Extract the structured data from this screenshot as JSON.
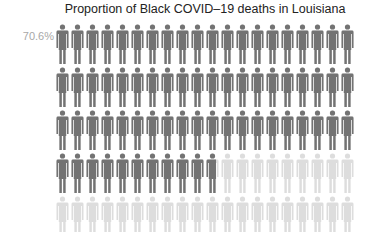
{
  "chart_data": {
    "type": "pictograph",
    "title": "Proportion of Black COVID–19 deaths in Louisiana",
    "value_label": "70.6%",
    "value": 70.6,
    "total_icons": 100,
    "icons_per_row": 20,
    "rows": 5,
    "icon": "person-icon",
    "filled_color": "#737373",
    "empty_color": "#dddddd"
  },
  "layout": {
    "left": 55,
    "icon_width": 15,
    "row_top": [
      24,
      67,
      110,
      153,
      196
    ],
    "row_height": 43
  }
}
